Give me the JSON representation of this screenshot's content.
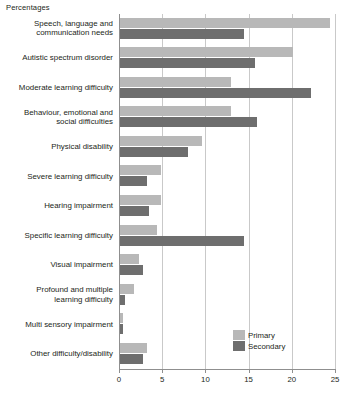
{
  "chart_data": {
    "type": "bar",
    "orientation": "horizontal",
    "title": "",
    "axis_note": "Percentages",
    "xlabel": "",
    "ylabel": "",
    "xlim": [
      0,
      25
    ],
    "xticks": [
      0,
      5,
      10,
      15,
      20,
      25
    ],
    "xtick_labels": [
      "0",
      "5",
      "10",
      "15",
      "20",
      "25"
    ],
    "grid": true,
    "legend_position": "bottom-right",
    "categories": [
      "Speech, language and communication needs",
      "Autistic spectrum disorder",
      "Moderate learning difficulty",
      "Behaviour, emotional and social difficulties",
      "Physical disability",
      "Severe learning difficulty",
      "Hearing impairment",
      "Specific learning difficulty",
      "Visual impairment",
      "Profound and multiple learning difficulty",
      "Multi sensory impairment",
      "Other difficulty/disability"
    ],
    "category_lines": [
      [
        "Speech, language and",
        "communication needs"
      ],
      [
        "Autistic spectrum disorder"
      ],
      [
        "Moderate learning difficulty"
      ],
      [
        "Behaviour, emotional and",
        "social difficulties"
      ],
      [
        "Physical disability"
      ],
      [
        "Severe learning difficulty"
      ],
      [
        "Hearing impairment"
      ],
      [
        "Specific learning difficulty"
      ],
      [
        "Visual impairment"
      ],
      [
        "Profound and multiple",
        "learning difficulty"
      ],
      [
        "Multi sensory impairment"
      ],
      [
        "Other difficulty/disability"
      ]
    ],
    "series": [
      {
        "name": "Primary",
        "color": "#b8b8b8",
        "values": [
          24.3,
          20.0,
          12.9,
          12.8,
          9.5,
          4.7,
          4.7,
          4.3,
          2.2,
          1.6,
          0.4,
          3.1
        ]
      },
      {
        "name": "Secondary",
        "color": "#6e6e6e",
        "values": [
          14.3,
          15.6,
          22.1,
          15.9,
          7.9,
          3.1,
          3.3,
          14.3,
          2.7,
          0.6,
          0.3,
          2.7
        ]
      }
    ]
  },
  "legend": {
    "items": [
      {
        "label": "Primary",
        "color": "#b8b8b8"
      },
      {
        "label": "Secondary",
        "color": "#6e6e6e"
      }
    ]
  }
}
